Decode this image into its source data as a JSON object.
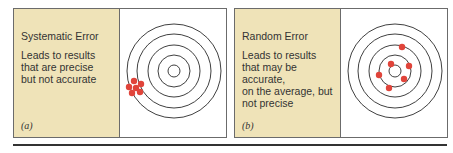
{
  "panels": [
    {
      "id": "a",
      "title": "Systematic Error",
      "description": "Leads to results that are precise but not accurate",
      "description_lines": [
        "Leads to results",
        "that are precise",
        "but not accurate"
      ],
      "label": "(a)",
      "target": {
        "center": [
          54,
          62
        ],
        "ring_radii": [
          6,
          16,
          26,
          37,
          47
        ],
        "hits": [
          [
            14,
            72
          ],
          [
            9,
            78
          ],
          [
            16,
            79
          ],
          [
            21,
            75
          ],
          [
            12,
            84
          ],
          [
            20,
            83
          ]
        ]
      }
    },
    {
      "id": "b",
      "title": "Random Error",
      "description": "Leads to results that may be accurate, on the average, but not precise",
      "description_lines": [
        "Leads to results",
        "that may be accurate,",
        "on the average, but",
        "not precise"
      ],
      "label": "(b)",
      "target": {
        "center": [
          54,
          62
        ],
        "ring_radii": [
          6,
          16,
          26,
          37,
          47
        ],
        "hits": [
          [
            61,
            38
          ],
          [
            50,
            55
          ],
          [
            68,
            57
          ],
          [
            38,
            66
          ],
          [
            63,
            70
          ],
          [
            48,
            79
          ]
        ]
      }
    }
  ],
  "colors": {
    "caption_bg": "#efe3b8",
    "ring": "#2a2a2a",
    "hit": "#e0443a",
    "frame": "#6b6b6b"
  }
}
